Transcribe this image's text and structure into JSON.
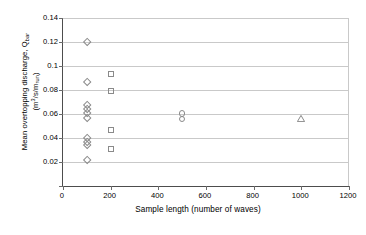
{
  "chart_data": {
    "type": "scatter",
    "title": "",
    "xlabel": "Sample length (number of waves)",
    "ylabel_line1": "Mean overtopping discharge, Q",
    "ylabel_sub1": "bar",
    "ylabel_line2_open": "(m",
    "ylabel_sup": "3",
    "ylabel_line2_mid": "/s/m",
    "ylabel_sub2": "run",
    "ylabel_line2_close": ")",
    "ylabel_plain": "Mean overtopping discharge, Qbar (m3/s/mrun)",
    "xlim": [
      0,
      1200
    ],
    "ylim": [
      0,
      0.14
    ],
    "xticks": [
      0,
      200,
      400,
      600,
      800,
      1000,
      1200
    ],
    "xtick_labels": [
      "0",
      "200",
      "400",
      "600",
      "800",
      "1000",
      "1200"
    ],
    "yticks": [
      0,
      0.02,
      0.04,
      0.06,
      0.08,
      0.1,
      0.12,
      0.14
    ],
    "ytick_labels": [
      "0",
      "0.02",
      "0.04",
      "0.06",
      "0.08",
      "0.1",
      "0.12",
      "0.14"
    ],
    "grid": "horizontal",
    "legend": "none",
    "marker_color": "#8a8a8a",
    "series": [
      {
        "name": "Sample length 100",
        "marker": "diamond",
        "points": [
          {
            "x": 100,
            "y": 0.1195
          },
          {
            "x": 100,
            "y": 0.0868
          },
          {
            "x": 100,
            "y": 0.0672
          },
          {
            "x": 100,
            "y": 0.064
          },
          {
            "x": 100,
            "y": 0.0608
          },
          {
            "x": 100,
            "y": 0.0562
          },
          {
            "x": 100,
            "y": 0.04
          },
          {
            "x": 100,
            "y": 0.0368
          },
          {
            "x": 100,
            "y": 0.034
          },
          {
            "x": 100,
            "y": 0.0215
          }
        ]
      },
      {
        "name": "Sample length 200",
        "marker": "square",
        "points": [
          {
            "x": 200,
            "y": 0.0935
          },
          {
            "x": 200,
            "y": 0.0793
          },
          {
            "x": 200,
            "y": 0.0465
          },
          {
            "x": 200,
            "y": 0.0305
          }
        ]
      },
      {
        "name": "Sample length 500",
        "marker": "circle",
        "points": [
          {
            "x": 500,
            "y": 0.0605
          },
          {
            "x": 500,
            "y": 0.0558
          }
        ]
      },
      {
        "name": "Sample length 1000",
        "marker": "triangle",
        "points": [
          {
            "x": 1000,
            "y": 0.0565
          }
        ]
      }
    ]
  }
}
